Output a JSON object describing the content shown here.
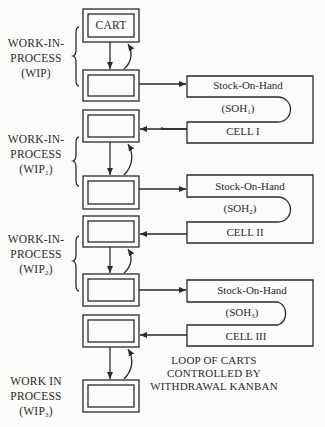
{
  "diagram": {
    "type": "kanban-cart-loop",
    "cart_label": "CART",
    "wip_groups": [
      {
        "line1": "WORK-IN-",
        "line2": "PROCESS",
        "line3_prefix": "(WIP",
        "sub": "",
        "line3_suffix": ")"
      },
      {
        "line1": "WORK-IN-",
        "line2": "PROCESS",
        "line3_prefix": "(WIP",
        "sub": "1",
        "line3_suffix": ")"
      },
      {
        "line1": "WORK-IN-",
        "line2": "PROCESS",
        "line3_prefix": "(WIP",
        "sub": "2",
        "line3_suffix": ")"
      },
      {
        "line1": "WORK IN",
        "line2": "PROCESS",
        "line3_prefix": "(WIP",
        "sub": "3",
        "line3_suffix": ")"
      }
    ],
    "cells": [
      {
        "title": "Stock-On-Hand",
        "soh_prefix": "(SOH",
        "soh_sub": "1",
        "soh_suffix": ")",
        "name": "CELL I"
      },
      {
        "title": "Stock-On-Hand",
        "soh_prefix": "(SOH",
        "soh_sub": "2",
        "soh_suffix": ")",
        "name": "CELL II"
      },
      {
        "title": "Stock-On-Hand",
        "soh_prefix": "(SOH",
        "soh_sub": "3",
        "soh_suffix": ")",
        "name": "CELL III"
      }
    ],
    "loop_note": {
      "line1": "LOOP OF CARTS",
      "line2": "CONTROLLED BY",
      "line3": "WITHDRAWAL KANBAN"
    },
    "colors": {
      "line": "#2a2a2a",
      "background": "#fbfbfa"
    }
  }
}
